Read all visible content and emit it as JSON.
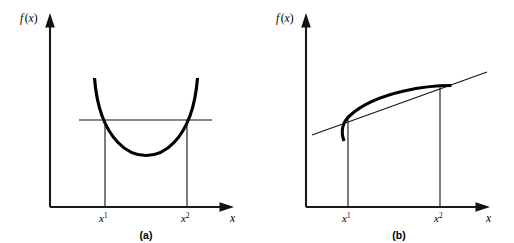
{
  "figure": {
    "background_color": "#ffffff",
    "ink_color": "#000000",
    "panels": [
      {
        "id": "panel-a",
        "caption": "(a)",
        "y_axis_label": "f (x)",
        "x_axis_label": "x",
        "tick_labels": [
          {
            "base": "x",
            "superscript": "1"
          },
          {
            "base": "x",
            "superscript": "2"
          }
        ],
        "curve_type": "convex",
        "secant_type": "horizontal-chord"
      },
      {
        "id": "panel-b",
        "caption": "(b)",
        "y_axis_label": "f (x)",
        "x_axis_label": "x",
        "tick_labels": [
          {
            "base": "x",
            "superscript": "1"
          },
          {
            "base": "x",
            "superscript": "2"
          }
        ],
        "curve_type": "concave",
        "secant_type": "sloped-secant"
      }
    ]
  },
  "chart_data": [
    {
      "type": "line",
      "title": "(a)",
      "xlabel": "x",
      "ylabel": "f (x)",
      "grid": false,
      "legend": "none",
      "axis_style": "arrow-headed open axes, no numeric ticks",
      "xlim": [
        0,
        1
      ],
      "ylim": [
        0,
        1
      ],
      "annotations": [
        "x¹",
        "x²"
      ],
      "series": [
        {
          "name": "convex function f(x)",
          "style": "thick solid",
          "x": [
            0.36,
            0.4,
            0.45,
            0.5,
            0.56,
            0.62,
            0.68,
            0.74,
            0.8,
            0.86,
            0.92
          ],
          "y": [
            0.72,
            0.6,
            0.5,
            0.42,
            0.37,
            0.355,
            0.37,
            0.42,
            0.5,
            0.6,
            0.72
          ]
        },
        {
          "name": "horizontal chord through f(x¹) and f(x²)",
          "style": "thin solid",
          "x": [
            0.3,
            0.97
          ],
          "y": [
            0.555,
            0.555
          ]
        },
        {
          "name": "dropline at x¹",
          "style": "thin vertical",
          "x": [
            0.393,
            0.393
          ],
          "y": [
            0.0,
            0.555
          ]
        },
        {
          "name": "dropline at x²",
          "style": "thin vertical",
          "x": [
            0.875,
            0.875
          ],
          "y": [
            0.0,
            0.555
          ]
        }
      ]
    },
    {
      "type": "line",
      "title": "(b)",
      "xlabel": "x",
      "ylabel": "f (x)",
      "grid": false,
      "legend": "none",
      "axis_style": "arrow-headed open axes, no numeric ticks",
      "xlim": [
        0,
        1
      ],
      "ylim": [
        0,
        1
      ],
      "annotations": [
        "x¹",
        "x²"
      ],
      "series": [
        {
          "name": "concave function f(x)",
          "style": "thick solid",
          "x": [
            0.28,
            0.31,
            0.35,
            0.42,
            0.5,
            0.58,
            0.66,
            0.74,
            0.82,
            0.9,
            0.97
          ],
          "y": [
            0.42,
            0.49,
            0.545,
            0.6,
            0.645,
            0.675,
            0.7,
            0.715,
            0.723,
            0.724,
            0.724
          ]
        },
        {
          "name": "secant line through f(x¹) and f(x²)",
          "style": "thin solid",
          "x": [
            0.18,
            1.0
          ],
          "y": [
            0.475,
            0.8
          ]
        },
        {
          "name": "dropline at x¹",
          "style": "thin vertical",
          "x": [
            0.345,
            0.345
          ],
          "y": [
            0.0,
            0.545
          ]
        },
        {
          "name": "dropline at x²",
          "style": "thin vertical",
          "x": [
            0.8,
            0.8
          ],
          "y": [
            0.0,
            0.722
          ]
        }
      ]
    }
  ]
}
